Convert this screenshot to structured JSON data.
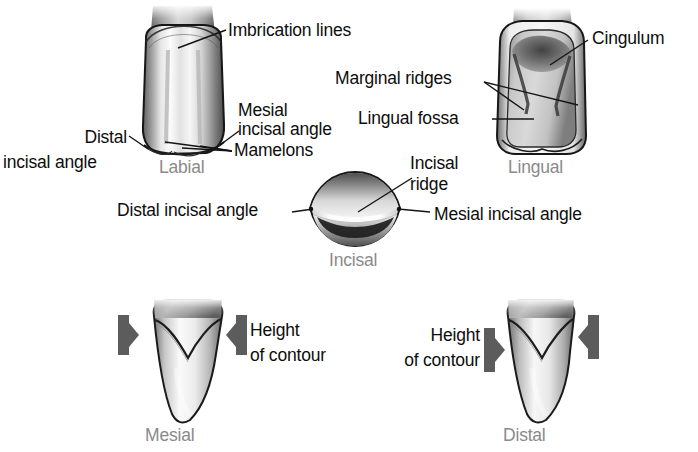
{
  "figure": {
    "text_color": "#0d0d0d",
    "view_label_color": "#8a8a8a",
    "background": "#ffffff"
  },
  "views": {
    "labial": {
      "name": "Labial"
    },
    "lingual": {
      "name": "Lingual"
    },
    "incisal": {
      "name": "Incisal"
    },
    "mesial": {
      "name": "Mesial"
    },
    "distal": {
      "name": "Distal"
    }
  },
  "annotations": {
    "imbrication_lines": "Imbrication lines",
    "mesial_incisal_angle_labial_1": "Mesial",
    "mesial_incisal_angle_labial_2": "incisal angle",
    "mamelons": "Mamelons",
    "distal_incisal_angle_labial_1": "Distal",
    "distal_incisal_angle_labial_2": "incisal angle",
    "cingulum": "Cingulum",
    "marginal_ridges": "Marginal ridges",
    "lingual_fossa": "Lingual fossa",
    "incisal_ridge_1": "Incisal",
    "incisal_ridge_2": "ridge",
    "distal_incisal_angle_incisal": "Distal incisal angle",
    "mesial_incisal_angle_incisal": "Mesial incisal angle",
    "height_of_contour_mesial_1": "Height",
    "height_of_contour_mesial_2": "of contour",
    "height_of_contour_distal_1": "Height",
    "height_of_contour_distal_2": "of contour"
  }
}
